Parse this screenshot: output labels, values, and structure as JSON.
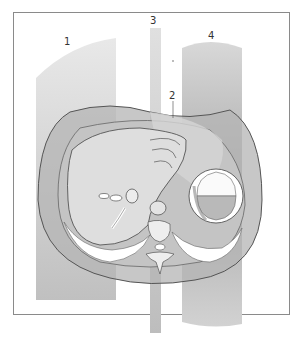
{
  "figure": {
    "type": "anatomical cross-section illustration (abdominal CT plane)",
    "labels": [
      {
        "id": "1",
        "text": "1"
      },
      {
        "id": "2",
        "text": "2"
      },
      {
        "id": "3",
        "text": "3"
      },
      {
        "id": "4",
        "text": "4"
      }
    ],
    "colors": {
      "frame": "#8a8a8a",
      "band_light": "#cfcfcf",
      "band_dark": "#a9a9a9",
      "body": "#b8b8b8",
      "organ": "#d9d9d9",
      "outline": "#555555"
    }
  }
}
